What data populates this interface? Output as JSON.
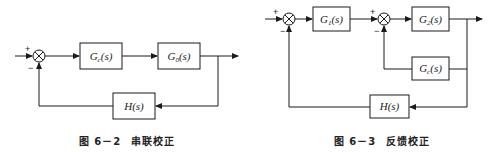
{
  "figures": [
    {
      "id": "fig-6-2",
      "caption_number": "图 6－2",
      "caption_title": "串联校正",
      "blocks": {
        "controller": {
          "main": "G",
          "sub": "c",
          "arg": "(s)"
        },
        "plant": {
          "main": "G",
          "sub": "0",
          "arg": "(s)"
        },
        "feedback": {
          "main": "H",
          "sub": "",
          "arg": "(s)"
        }
      },
      "summing_junction": {
        "plus": "+",
        "minus": "−"
      }
    },
    {
      "id": "fig-6-3",
      "caption_number": "图 6－3",
      "caption_title": "反馈校正",
      "blocks": {
        "forward1": {
          "main": "G",
          "sub": "1",
          "arg": "(s)"
        },
        "forward2": {
          "main": "G",
          "sub": "2",
          "arg": "(s)"
        },
        "local_feedback": {
          "main": "G",
          "sub": "c",
          "arg": "(s)"
        },
        "feedback": {
          "main": "H",
          "sub": "",
          "arg": "(s)"
        }
      },
      "summing_junction_outer": {
        "plus": "+",
        "minus": "−"
      },
      "summing_junction_inner": {
        "plus": "+",
        "minus": "−"
      }
    }
  ],
  "colors": {
    "stroke": "#1a1a1a",
    "background": "#ffffff"
  }
}
